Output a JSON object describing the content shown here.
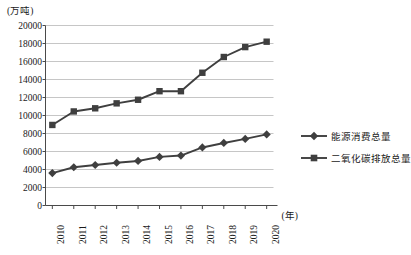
{
  "chart_data": {
    "type": "line",
    "title": "",
    "subtitle": "",
    "xlabel": "(年)",
    "ylabel": "(万吨)",
    "categories": [
      "2010",
      "2011",
      "2012",
      "2013",
      "2014",
      "2015",
      "2016",
      "2017",
      "2018",
      "2019",
      "2020"
    ],
    "x": [
      2010,
      2011,
      2012,
      2013,
      2014,
      2015,
      2016,
      2017,
      2018,
      2019,
      2020
    ],
    "series": [
      {
        "name": "能源消费总量",
        "marker": "diamond",
        "color": "#3f3f3f",
        "values": [
          3600,
          4250,
          4500,
          4750,
          4950,
          5400,
          5550,
          6450,
          6950,
          7400,
          7900
        ]
      },
      {
        "name": "二氧化碳排放总量",
        "marker": "square",
        "color": "#3f3f3f",
        "values": [
          8950,
          10450,
          10800,
          11350,
          11750,
          12700,
          12700,
          14750,
          16500,
          17600,
          18200
        ]
      }
    ],
    "ylim": [
      0,
      20000
    ],
    "yticks": [
      0,
      2000,
      4000,
      6000,
      8000,
      10000,
      12000,
      14000,
      16000,
      18000,
      20000
    ],
    "ytick_labels": [
      "0",
      "2000",
      "4000",
      "6000",
      "8000",
      "10000",
      "12000",
      "14000",
      "16000",
      "18000",
      "20000"
    ],
    "grid": true,
    "grid_axis": "y",
    "grid_color": "#b8b8b8",
    "legend_position": "right",
    "axis_color": "#4a4a4a",
    "plot_bg": "#ffffff"
  },
  "legend": {
    "items": [
      {
        "label": "能源消费总量",
        "marker": "diamond"
      },
      {
        "label": "二氧化碳排放总量",
        "marker": "square"
      }
    ]
  }
}
